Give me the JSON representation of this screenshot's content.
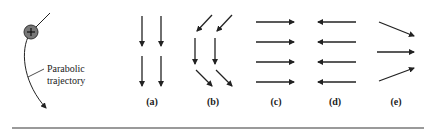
{
  "figure": {
    "charge": {
      "symbol": "+",
      "fill": "#777777"
    },
    "trajectory_label": [
      "Parabolic",
      "trajectory"
    ],
    "panels": [
      {
        "id": "a",
        "label": "(a)",
        "description": "uniform downward vectors"
      },
      {
        "id": "b",
        "label": "(b)",
        "description": "vectors changing direction along a curve"
      },
      {
        "id": "c",
        "label": "(c)",
        "description": "uniform rightward vectors"
      },
      {
        "id": "d",
        "label": "(d)",
        "description": "uniform leftward vectors"
      },
      {
        "id": "e",
        "label": "(e)",
        "description": "converging vectors"
      }
    ],
    "colors": {
      "arrow": "#222222",
      "rule": "#9a9a9a"
    }
  }
}
